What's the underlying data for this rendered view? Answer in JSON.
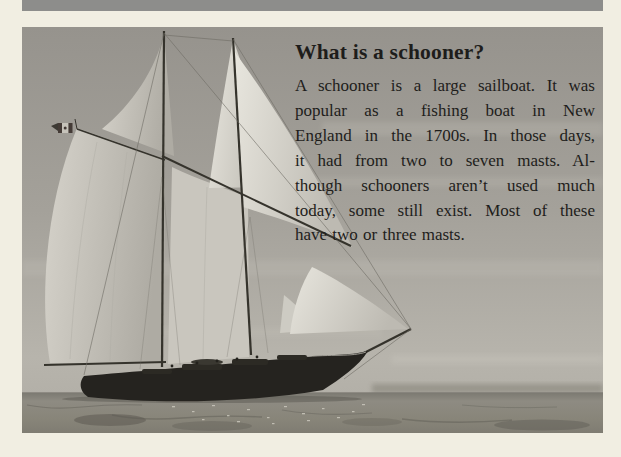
{
  "theme": {
    "background": "#f1eee2",
    "bar": "#8d8d8b",
    "text": "#1e1d1b",
    "sky": "#a3a09a",
    "sea": "#8a877e",
    "sail": "#d9d6ce",
    "hull": "#25231f"
  },
  "article": {
    "title": "What is a schooner?",
    "body_lines": [
      "A schooner is a large sailboat. It was",
      "popular as a fishing boat in New",
      "England in the 1700s. In those days,",
      "it had from two to seven masts. Al-",
      "though schooners aren’t used much",
      "today, some still exist. Most of these",
      "have two or three masts."
    ]
  },
  "photo": {
    "alt": "Two-masted schooner under full sail at sea, flying a small flag at the gaff peak"
  }
}
